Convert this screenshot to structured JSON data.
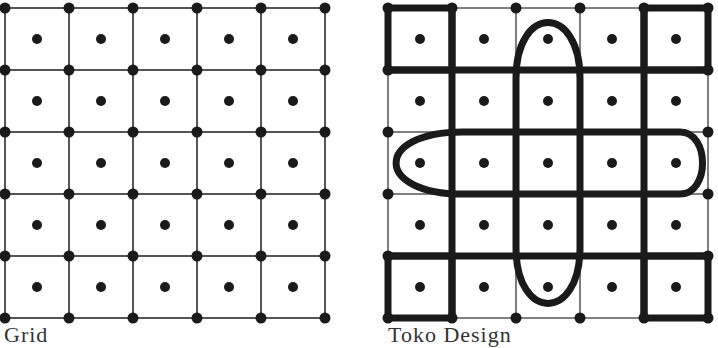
{
  "diagrams": [
    {
      "id": "grid",
      "caption": "Grid",
      "caption_pos": {
        "x": 4,
        "y": 322
      },
      "cols_x": [
        5,
        69,
        133,
        197,
        261,
        325
      ],
      "rows_y": [
        8,
        70,
        132,
        194,
        256,
        318
      ],
      "node_dots": "all-intersections",
      "center_dots": true
    },
    {
      "id": "toko-design",
      "caption": "Toko Design",
      "caption_pos": {
        "x": 388,
        "y": 322
      },
      "cols_x": [
        388,
        452,
        516,
        580,
        644,
        708
      ],
      "rows_y": [
        8,
        70,
        132,
        194,
        256,
        318
      ],
      "node_dots": "perimeter-only",
      "center_dots": true,
      "thick_lines": {
        "horizontal_full": [
          70,
          256
        ],
        "vertical_full": [
          452,
          644
        ],
        "corner_squares": [
          "top-left",
          "top-right",
          "bottom-left",
          "bottom-right"
        ]
      },
      "ovals": [
        {
          "name": "vertical-oval",
          "x1": 516,
          "x2": 580,
          "y1": 8,
          "y2": 318
        },
        {
          "name": "horizontal-oval",
          "x1": 388,
          "x2": 708,
          "y1": 132,
          "y2": 194
        }
      ]
    }
  ],
  "colors": {
    "ink": "#1a1a1a",
    "thin_line": "#555555",
    "background": "#ffffff"
  }
}
